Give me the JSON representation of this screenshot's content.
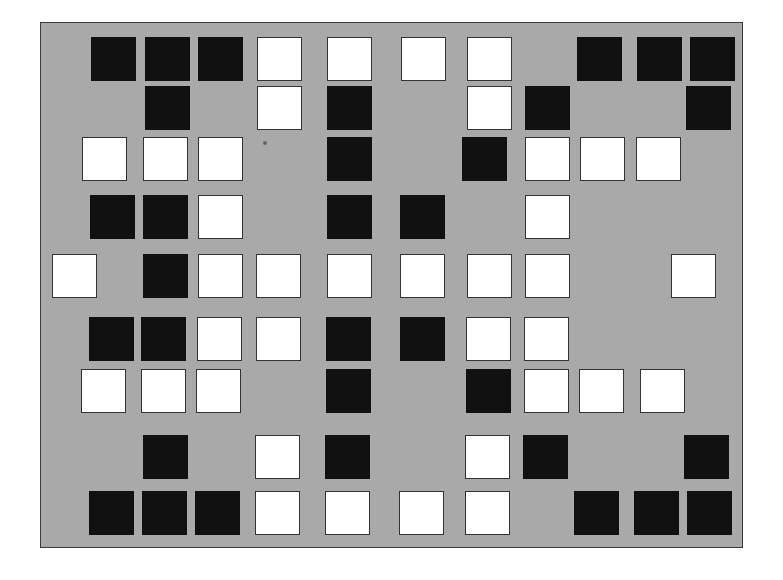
{
  "board": {
    "background": "#a9a9a9",
    "tile_colors": {
      "black": "#111111",
      "white": "#ffffff"
    },
    "rows": [
      {
        "y": 37,
        "tiles": [
          [
            "B",
            91
          ],
          [
            "B",
            145
          ],
          [
            "B",
            198
          ],
          [
            "W",
            257
          ],
          [
            "W",
            327
          ],
          [
            "W",
            401
          ],
          [
            "W",
            467
          ],
          [
            "B",
            577
          ],
          [
            "B",
            637
          ],
          [
            "B",
            690
          ]
        ]
      },
      {
        "y": 86,
        "tiles": [
          [
            "B",
            145
          ],
          [
            "W",
            257
          ],
          [
            "B",
            327
          ],
          [
            "W",
            467
          ],
          [
            "B",
            525
          ],
          [
            "B",
            686
          ]
        ]
      },
      {
        "y": 137,
        "tiles": [
          [
            "W",
            82
          ],
          [
            "W",
            143
          ],
          [
            "W",
            198
          ],
          [
            "B",
            327
          ],
          [
            "B",
            462
          ],
          [
            "W",
            525
          ],
          [
            "W",
            580
          ],
          [
            "W",
            636
          ]
        ]
      },
      {
        "y": 195,
        "tiles": [
          [
            "B",
            90
          ],
          [
            "B",
            143
          ],
          [
            "W",
            198
          ],
          [
            "B",
            327
          ],
          [
            "B",
            400
          ],
          [
            "W",
            525
          ]
        ]
      },
      {
        "y": 254,
        "tiles": [
          [
            "W",
            52
          ],
          [
            "B",
            143
          ],
          [
            "W",
            198
          ],
          [
            "W",
            256
          ],
          [
            "W",
            327
          ],
          [
            "W",
            400
          ],
          [
            "W",
            467
          ],
          [
            "W",
            525
          ],
          [
            "W",
            671
          ]
        ]
      },
      {
        "y": 317,
        "tiles": [
          [
            "B",
            89
          ],
          [
            "B",
            141
          ],
          [
            "W",
            197
          ],
          [
            "W",
            256
          ],
          [
            "B",
            326
          ],
          [
            "B",
            400
          ],
          [
            "W",
            466
          ],
          [
            "W",
            524
          ]
        ]
      },
      {
        "y": 369,
        "tiles": [
          [
            "W",
            81
          ],
          [
            "W",
            141
          ],
          [
            "W",
            196
          ],
          [
            "B",
            326
          ],
          [
            "B",
            466
          ],
          [
            "W",
            524
          ],
          [
            "W",
            579
          ],
          [
            "W",
            640
          ]
        ]
      },
      {
        "y": 435,
        "tiles": [
          [
            "B",
            143
          ],
          [
            "W",
            255
          ],
          [
            "B",
            325
          ],
          [
            "W",
            465
          ],
          [
            "B",
            523
          ],
          [
            "B",
            684
          ]
        ]
      },
      {
        "y": 491,
        "tiles": [
          [
            "B",
            89
          ],
          [
            "B",
            142
          ],
          [
            "B",
            195
          ],
          [
            "W",
            255
          ],
          [
            "W",
            325
          ],
          [
            "W",
            399
          ],
          [
            "W",
            465
          ],
          [
            "B",
            574
          ],
          [
            "B",
            634
          ],
          [
            "B",
            687
          ]
        ]
      }
    ]
  }
}
